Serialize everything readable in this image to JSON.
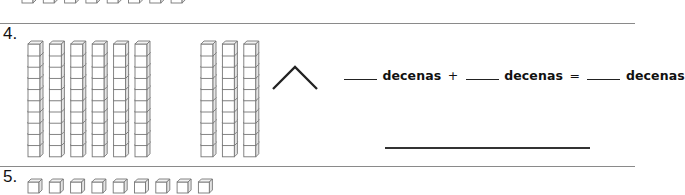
{
  "worksheet": {
    "top_partial": {
      "unit_cubes": 8
    },
    "problem_4": {
      "number": "4.",
      "group_a": {
        "rods": 6,
        "cubes_per_rod": 10
      },
      "group_b": {
        "rods": 3,
        "cubes_per_rod": 10
      },
      "symbol": "chevron-up",
      "equation": {
        "blank_1": "____",
        "word_1": "decenas",
        "plus": "+",
        "blank_2": "____",
        "word_2": "decenas",
        "equals": "=",
        "blank_3": "____",
        "word_3": "decenas"
      },
      "answer_line": ""
    },
    "problem_5": {
      "number": "5.",
      "unit_cubes": 9
    }
  }
}
